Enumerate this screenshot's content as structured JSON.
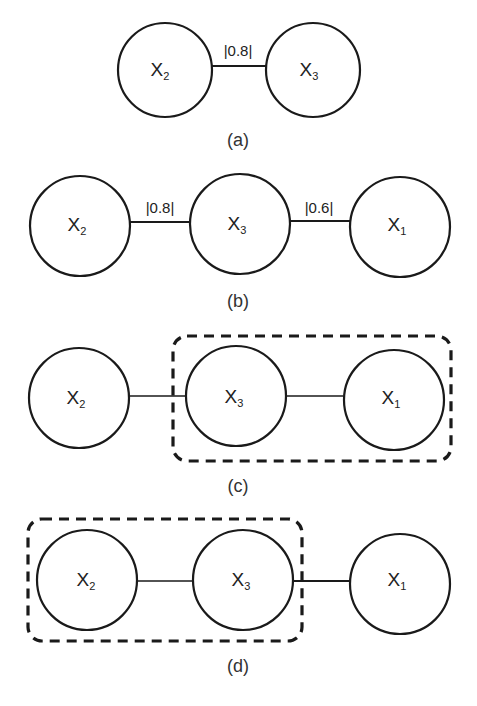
{
  "panels": {
    "a": {
      "caption": "(a)",
      "nodes": [
        {
          "id": "X2",
          "base": "X",
          "sub": "2"
        },
        {
          "id": "X3",
          "base": "X",
          "sub": "3"
        }
      ],
      "edges": [
        {
          "from": "X2",
          "to": "X3",
          "label": "|0.8|"
        }
      ]
    },
    "b": {
      "caption": "(b)",
      "nodes": [
        {
          "id": "X2",
          "base": "X",
          "sub": "2"
        },
        {
          "id": "X3",
          "base": "X",
          "sub": "3"
        },
        {
          "id": "X1",
          "base": "X",
          "sub": "1"
        }
      ],
      "edges": [
        {
          "from": "X2",
          "to": "X3",
          "label": "|0.8|"
        },
        {
          "from": "X3",
          "to": "X1",
          "label": "|0.6|"
        }
      ]
    },
    "c": {
      "caption": "(c)",
      "nodes": [
        {
          "id": "X2",
          "base": "X",
          "sub": "2"
        },
        {
          "id": "X3",
          "base": "X",
          "sub": "3"
        },
        {
          "id": "X1",
          "base": "X",
          "sub": "1"
        }
      ],
      "edges": [
        {
          "from": "X2",
          "to": "X3"
        },
        {
          "from": "X3",
          "to": "X1"
        }
      ],
      "group": [
        "X3",
        "X1"
      ]
    },
    "d": {
      "caption": "(d)",
      "nodes": [
        {
          "id": "X2",
          "base": "X",
          "sub": "2"
        },
        {
          "id": "X3",
          "base": "X",
          "sub": "3"
        },
        {
          "id": "X1",
          "base": "X",
          "sub": "1"
        }
      ],
      "edges": [
        {
          "from": "X2",
          "to": "X3"
        },
        {
          "from": "X3",
          "to": "X1"
        }
      ],
      "group": [
        "X2",
        "X3"
      ]
    }
  },
  "colors": {
    "stroke": "#1a1a1a",
    "background": "#ffffff",
    "text": "#222222"
  }
}
